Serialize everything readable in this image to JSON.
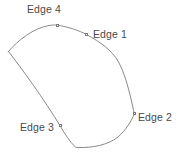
{
  "figure": {
    "title": "",
    "background_color": "#ffffff",
    "outline_color": "#8a8a8a",
    "outline_width": 1,
    "label_color": "#4a4a4a",
    "marker_color": "#7d7d7d",
    "marker_fill": "#ffffff",
    "width": 188,
    "height": 156
  },
  "shape": {
    "name": "closed-outline-quadrilateral",
    "path": "M 8.5 51.5 C 18 40 34 28 49 25.5 C 52 25 55 24.8 57.5 25.2 C 68 26.8 79 30.5 86.5 34.5 C 100 42 112 50 118.5 62 C 124 72 128 86 131 99 C 132.4 104.5 133.4 109.5 134.2 114 C 132 120 126 130 118 137 C 108 145 92 148 78 147.5 C 77 147.4 76.2 147.3 75.5 147.2 C 70 142 64.5 133.5 60.5 126.5 C 44 99 22 69 8.5 51.5 Z"
  },
  "labels": [
    {
      "id": "edge-4",
      "text": "Edge 4",
      "x": 27,
      "y": 4
    },
    {
      "id": "edge-1",
      "text": "Edge 1",
      "x": 93,
      "y": 29
    },
    {
      "id": "edge-2",
      "text": "Edge 2",
      "x": 138,
      "y": 112
    },
    {
      "id": "edge-3",
      "text": "Edge 3",
      "x": 20,
      "y": 122
    }
  ],
  "markers": [
    {
      "id": "marker-edge-4",
      "x": 56,
      "y": 24
    },
    {
      "id": "marker-edge-1",
      "x": 85,
      "y": 33
    },
    {
      "id": "marker-edge-2",
      "x": 133,
      "y": 112
    },
    {
      "id": "marker-edge-3",
      "x": 59,
      "y": 124
    }
  ]
}
